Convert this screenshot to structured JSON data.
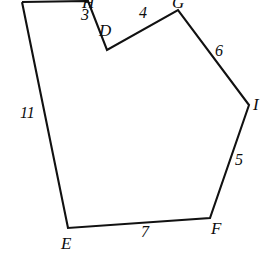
{
  "figure": {
    "background_color": "#ffffff",
    "stroke_color": "#111111",
    "text_color": "#0d0d0d",
    "vertices": [
      {
        "id": "A",
        "label": "",
        "x": 22,
        "y": 2,
        "clipped": true
      },
      {
        "id": "H",
        "label": "H",
        "x": 88,
        "y": 1,
        "clipped": true
      },
      {
        "id": "D",
        "label": "D",
        "x": 107,
        "y": 50,
        "clipped": false
      },
      {
        "id": "G",
        "label": "G",
        "x": 178,
        "y": 10,
        "clipped": true
      },
      {
        "id": "I",
        "label": "I",
        "x": 249,
        "y": 105,
        "clipped": true
      },
      {
        "id": "F",
        "label": "F",
        "x": 210,
        "y": 218,
        "clipped": false
      },
      {
        "id": "E",
        "label": "E",
        "x": 68,
        "y": 228,
        "clipped": false
      }
    ],
    "vertex_labels": [
      {
        "name": "vertex-label-h",
        "text": "H",
        "x": 82,
        "y": -6
      },
      {
        "name": "vertex-label-d",
        "text": "D",
        "x": 99,
        "y": 22
      },
      {
        "name": "vertex-label-g",
        "text": "G",
        "x": 172,
        "y": -6
      },
      {
        "name": "vertex-label-i",
        "text": "I",
        "x": 253,
        "y": 96
      },
      {
        "name": "vertex-label-f",
        "text": "F",
        "x": 211,
        "y": 220
      },
      {
        "name": "vertex-label-e",
        "text": "E",
        "x": 61,
        "y": 235
      }
    ],
    "edges": [
      {
        "name": "edge-hd",
        "from": "H",
        "to": "D",
        "length": "3",
        "label_x": 81,
        "label_y": 7
      },
      {
        "name": "edge-dg",
        "from": "D",
        "to": "G",
        "length": "4",
        "label_x": 139,
        "label_y": 5
      },
      {
        "name": "edge-gi",
        "from": "G",
        "to": "I",
        "length": "6",
        "label_x": 215,
        "label_y": 43
      },
      {
        "name": "edge-if",
        "from": "I",
        "to": "F",
        "length": "5",
        "label_x": 235,
        "label_y": 152
      },
      {
        "name": "edge-fe",
        "from": "F",
        "to": "E",
        "length": "7",
        "label_x": 141,
        "label_y": 224
      },
      {
        "name": "edge-ea",
        "from": "E",
        "to": "A",
        "length": "11",
        "label_x": 20,
        "label_y": 105
      }
    ],
    "outline_points": "22,2 88,1 107,50 178,10 249,105 210,218 68,228 22,2"
  }
}
